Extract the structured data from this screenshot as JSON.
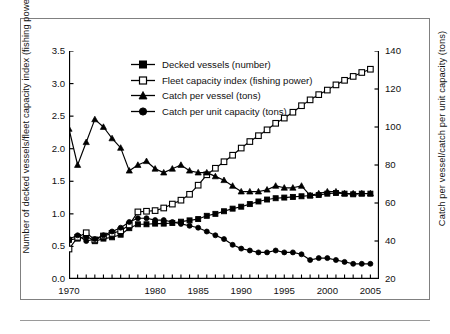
{
  "figure": {
    "caption_rule": true
  },
  "axes": {
    "y_left": {
      "title": "Number of decked vessels/fleet capacity index (fishing power) (millions)",
      "ticks": [
        "0.0",
        "0.5",
        "1.0",
        "1.5",
        "2.0",
        "2.5",
        "3.0",
        "3.5"
      ]
    },
    "y_right": {
      "title": "Catch per vessel/catch per unit capacity (tons)",
      "ticks": [
        "20",
        "40",
        "60",
        "80",
        "100",
        "120",
        "140"
      ]
    },
    "x": {
      "title": "",
      "ticks": [
        "1970",
        "1980",
        "1985",
        "1990",
        "1995",
        "2000",
        "2005"
      ]
    }
  },
  "legend": [
    {
      "label": "Decked vessels (number)",
      "marker": "filled-square",
      "color": "#000000"
    },
    {
      "label": "Fleet capacity index (fishing power)",
      "marker": "open-square",
      "color": "#000000"
    },
    {
      "label": "Catch per vessel (tons)",
      "marker": "filled-triangle",
      "color": "#000000"
    },
    {
      "label": "Catch per unit capacity (tons)",
      "marker": "filled-circle",
      "color": "#000000"
    }
  ],
  "chart_data": {
    "type": "line",
    "title": "",
    "xlabel": "",
    "ylabel": "Number of decked vessels/fleet capacity index (fishing power) (millions)",
    "y2label": "Catch per vessel/catch per unit capacity (tons)",
    "xlim": [
      1970,
      2006
    ],
    "ylim": [
      0.0,
      3.5
    ],
    "y2lim": [
      20,
      140
    ],
    "grid": false,
    "legend_position": "top-left-inside",
    "x": [
      1970,
      1971,
      1972,
      1973,
      1974,
      1975,
      1976,
      1977,
      1978,
      1979,
      1980,
      1981,
      1982,
      1983,
      1984,
      1985,
      1986,
      1987,
      1988,
      1989,
      1990,
      1991,
      1992,
      1993,
      1994,
      1995,
      1996,
      1997,
      1998,
      1999,
      2000,
      2001,
      2002,
      2003,
      2004,
      2005
    ],
    "series": [
      {
        "name": "Decked vessels (number)",
        "axis": "left",
        "unit": "millions",
        "marker": "filled-square",
        "values": [
          0.6,
          0.62,
          0.66,
          0.58,
          0.62,
          0.64,
          0.68,
          0.78,
          0.84,
          0.84,
          0.85,
          0.85,
          0.86,
          0.88,
          0.9,
          0.92,
          0.97,
          1.0,
          1.04,
          1.08,
          1.11,
          1.15,
          1.19,
          1.22,
          1.24,
          1.25,
          1.26,
          1.27,
          1.28,
          1.29,
          1.31,
          1.32,
          1.31,
          1.3,
          1.31,
          1.31
        ]
      },
      {
        "name": "Fleet capacity index (fishing power)",
        "axis": "left",
        "unit": "millions",
        "marker": "open-square",
        "values": [
          0.46,
          0.64,
          0.71,
          0.6,
          0.66,
          0.7,
          0.74,
          0.83,
          1.03,
          1.04,
          1.05,
          1.09,
          1.15,
          1.21,
          1.3,
          1.44,
          1.6,
          1.7,
          1.8,
          1.9,
          2.01,
          2.11,
          2.2,
          2.29,
          2.39,
          2.47,
          2.56,
          2.66,
          2.75,
          2.83,
          2.9,
          2.98,
          3.05,
          3.11,
          3.17,
          3.22
        ]
      },
      {
        "name": "Catch per vessel (tons)",
        "axis": "right",
        "unit": "tons",
        "marker": "filled-triangle",
        "values": [
          99,
          80,
          92,
          104,
          100,
          94,
          89,
          77,
          80,
          82,
          78,
          76,
          78,
          80,
          77,
          76,
          76,
          74,
          72,
          69,
          66,
          66,
          66,
          67,
          69,
          68,
          68,
          69,
          64,
          65,
          66,
          66,
          65,
          65,
          65,
          65
        ]
      },
      {
        "name": "Catch per unit capacity (tons)",
        "axis": "right",
        "unit": "tons",
        "marker": "filled-circle",
        "values": [
          41,
          43,
          40,
          41,
          43,
          45,
          47,
          50,
          52,
          52,
          51,
          51,
          50,
          49,
          48,
          47,
          45,
          43,
          41,
          38,
          36,
          35,
          34,
          34,
          35,
          34,
          34,
          33,
          30,
          31,
          31,
          30,
          29,
          28,
          28,
          28
        ]
      }
    ]
  }
}
